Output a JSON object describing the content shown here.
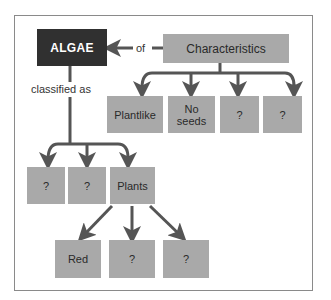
{
  "diagram": {
    "title": "ALGAE",
    "relation_of": "of",
    "relation_classified": "classified as",
    "characteristics": {
      "label": "Characteristics",
      "children": [
        "Plantlike",
        "No\nseeds",
        "?",
        "?"
      ]
    },
    "classification": {
      "children": [
        "?",
        "?",
        "Plants"
      ]
    },
    "plants": {
      "children": [
        "Red",
        "?",
        "?"
      ]
    },
    "colors": {
      "main_box": "#303030",
      "box": "#a9a9a9",
      "line": "#555555",
      "frame": "#8a8a8a"
    }
  }
}
